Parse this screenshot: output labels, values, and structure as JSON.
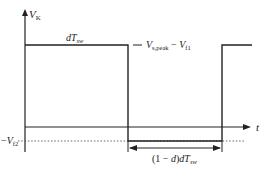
{
  "diagram": {
    "y_axis": {
      "label_main": "V",
      "label_sub": "K"
    },
    "x_axis": {
      "label": "t"
    },
    "high_level_label": {
      "main1": "V",
      "sub1": "s,peak",
      "op": " − ",
      "main2": "V",
      "sub2": "f1"
    },
    "low_level_label": {
      "prefix": "−",
      "main": "V",
      "sub": "f2"
    },
    "on_duration_label": {
      "d": "d",
      "T": "T",
      "sub": "sw"
    },
    "off_duration_label": {
      "prefix": "(1 − ",
      "d": "d",
      "mid": ")",
      "d2": "d",
      "T": "T",
      "sub": "sw"
    },
    "colors": {
      "line": "#222222",
      "dotted": "#555555",
      "background": "#ffffff"
    }
  }
}
